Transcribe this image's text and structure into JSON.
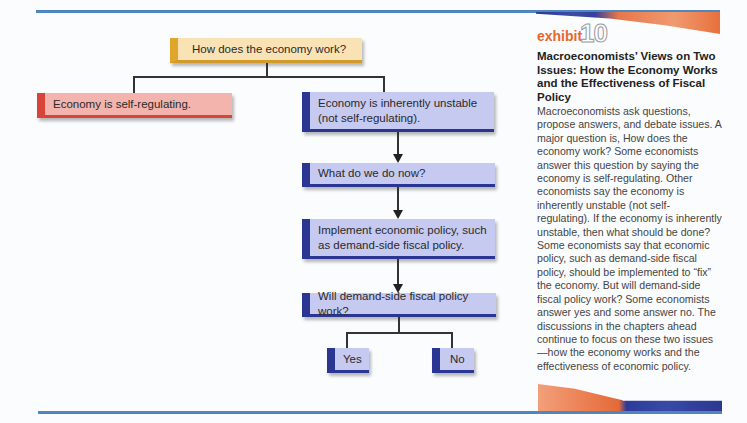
{
  "exhibit": {
    "label": "exhibit",
    "number": "10",
    "title": "Macroeconomists’ Views on Two Issues: How the Economy Works and the Effectiveness of Fiscal Policy",
    "body": "Macroeconomists ask questions, propose answers, and debate issues. A major question is, How does the economy work? Some economists answer this question by saying the economy is self-regulating. Other economists say the economy is inherently unstable (not self-regulating). If the economy is inherently unstable, then what should be done? Some economists say that economic policy, such as demand-side fiscal policy, should be implemented to “fix” the economy. But will demand-side fiscal policy work? Some economists answer yes and some answer no. The discussions in the chapters ahead continue to focus on these two issues—how the economy works and the effectiveness of economic policy."
  },
  "flowchart": {
    "root": "How does the economy  work?",
    "branch_left": "Economy is self-regulating.",
    "branch_right": "Economy is inherently unstable (not self-regulating).",
    "step_what_now": "What do we do now?",
    "step_implement": "Implement economic policy, such as demand-side fiscal policy.",
    "step_question": "Will demand-side fiscal policy work?",
    "answer_yes": "Yes",
    "answer_no": "No"
  },
  "colors": {
    "rule_blue": "#4f86c0",
    "exhibit_orange": "#e8672f",
    "yellow_box": "#f9e2b4",
    "yellow_accent": "#e0a62c",
    "red_box": "#f3b4ae",
    "red_accent": "#d9443a",
    "blue_box": "#c6c9f0",
    "blue_accent": "#2b3592"
  }
}
